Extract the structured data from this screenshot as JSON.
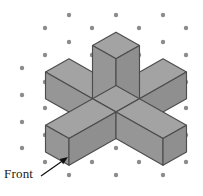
{
  "figure": {
    "type": "isometric-solid-drawing",
    "label_front": "Front",
    "colors": {
      "background": "#ffffff",
      "face_top": "#a3a3a3",
      "face_left": "#969696",
      "face_right": "#8f8f8f",
      "edge": "#4d4d4d",
      "dot": "#8c8c8c",
      "arrow": "#111111",
      "text": "#1a1a1a"
    },
    "grid": {
      "style": "isometric-dot-grid",
      "dot_radius": 2.2,
      "origin_x": 116,
      "origin_y": 112,
      "step_x": 23.5,
      "step_y": 13.3,
      "dots": [
        [
          69,
          15
        ],
        [
          116,
          15
        ],
        [
          163,
          15
        ],
        [
          45,
          28
        ],
        [
          92,
          28
        ],
        [
          139,
          28
        ],
        [
          186,
          28
        ],
        [
          69,
          42
        ],
        [
          116,
          42
        ],
        [
          163,
          42
        ],
        [
          45,
          55
        ],
        [
          92,
          55
        ],
        [
          139,
          55
        ],
        [
          186,
          55
        ],
        [
          22,
          68
        ],
        [
          69,
          68
        ],
        [
          116,
          68
        ],
        [
          163,
          68
        ],
        [
          45,
          82
        ],
        [
          92,
          82
        ],
        [
          139,
          82
        ],
        [
          186,
          82
        ],
        [
          22,
          95
        ],
        [
          69,
          95
        ],
        [
          116,
          95
        ],
        [
          163,
          95
        ],
        [
          45,
          108
        ],
        [
          92,
          108
        ],
        [
          139,
          108
        ],
        [
          186,
          108
        ],
        [
          22,
          122
        ],
        [
          69,
          122
        ],
        [
          116,
          122
        ],
        [
          163,
          122
        ],
        [
          45,
          135
        ],
        [
          92,
          135
        ],
        [
          139,
          135
        ],
        [
          186,
          135
        ],
        [
          22,
          148
        ],
        [
          69,
          148
        ],
        [
          116,
          148
        ],
        [
          163,
          148
        ],
        [
          45,
          162
        ],
        [
          92,
          162
        ],
        [
          139,
          162
        ],
        [
          186,
          162
        ],
        [
          69,
          175
        ],
        [
          116,
          175
        ],
        [
          163,
          175
        ]
      ]
    },
    "arrow": {
      "from_x": 41,
      "from_y": 176,
      "to_x": 68,
      "to_y": 157
    },
    "geometry": {
      "unit_x": 23.5,
      "unit_y": 13.3,
      "unit_z": 26.6,
      "arm_length_units": 2,
      "arm_width_units": 1,
      "description": "Central unit cube with five one-unit-wide arms: one rising vertically two units, and four horizontal arms two units long extending along the two isometric ground axes."
    }
  }
}
